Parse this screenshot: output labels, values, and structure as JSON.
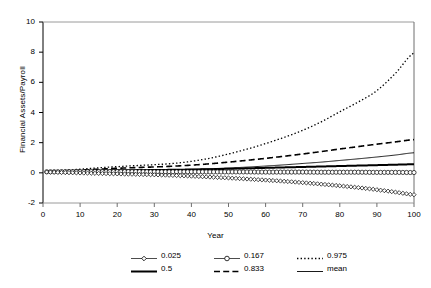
{
  "chart_data": {
    "type": "line",
    "title": "",
    "xlabel": "Year",
    "ylabel": "Financial Assets/Payroll",
    "xlim": [
      0,
      100
    ],
    "ylim": [
      -2,
      10
    ],
    "xticks": [
      "0",
      "10",
      "20",
      "30",
      "40",
      "50",
      "60",
      "70",
      "80",
      "90",
      "100"
    ],
    "yticks": [
      "-2",
      "0",
      "2",
      "4",
      "6",
      "8",
      "10"
    ],
    "grid": false,
    "legend_position": "below",
    "x": [
      1,
      5,
      10,
      15,
      20,
      25,
      30,
      35,
      40,
      45,
      50,
      55,
      60,
      65,
      70,
      75,
      80,
      85,
      90,
      95,
      100
    ],
    "series": [
      {
        "name": "0.025",
        "label": "0.025",
        "style": "line-marker-diamond",
        "color": "#000000",
        "values": [
          0.05,
          0.02,
          -0.01,
          -0.04,
          -0.07,
          -0.1,
          -0.13,
          -0.17,
          -0.22,
          -0.28,
          -0.34,
          -0.41,
          -0.48,
          -0.56,
          -0.65,
          -0.75,
          -0.86,
          -0.98,
          -1.12,
          -1.28,
          -1.45
        ]
      },
      {
        "name": "0.167",
        "label": "0.167",
        "style": "line-marker-circle",
        "color": "#000000",
        "values": [
          0.07,
          0.08,
          0.08,
          0.08,
          0.08,
          0.08,
          0.07,
          0.07,
          0.07,
          0.06,
          0.06,
          0.06,
          0.05,
          0.05,
          0.05,
          0.04,
          0.04,
          0.04,
          0.03,
          0.03,
          0.02
        ]
      },
      {
        "name": "0.975",
        "label": "0.975",
        "style": "dotted",
        "color": "#000000",
        "values": [
          0.1,
          0.16,
          0.24,
          0.33,
          0.41,
          0.48,
          0.54,
          0.62,
          0.76,
          0.97,
          1.25,
          1.57,
          1.94,
          2.35,
          2.82,
          3.38,
          4.05,
          4.7,
          5.45,
          6.6,
          7.95
        ]
      },
      {
        "name": "0.5",
        "label": "0.5",
        "style": "thick-solid",
        "color": "#000000",
        "values": [
          0.08,
          0.11,
          0.13,
          0.15,
          0.17,
          0.18,
          0.19,
          0.2,
          0.22,
          0.24,
          0.27,
          0.3,
          0.33,
          0.36,
          0.39,
          0.42,
          0.45,
          0.48,
          0.51,
          0.54,
          0.57
        ]
      },
      {
        "name": "0.833",
        "label": "0.833",
        "style": "dashed",
        "color": "#000000",
        "values": [
          0.09,
          0.13,
          0.18,
          0.24,
          0.3,
          0.35,
          0.39,
          0.44,
          0.51,
          0.6,
          0.71,
          0.83,
          0.96,
          1.1,
          1.25,
          1.41,
          1.58,
          1.74,
          1.9,
          2.05,
          2.2
        ]
      },
      {
        "name": "mean",
        "label": "mean",
        "style": "thin-solid",
        "color": "#000000",
        "values": [
          0.08,
          0.1,
          0.12,
          0.14,
          0.16,
          0.17,
          0.18,
          0.2,
          0.23,
          0.27,
          0.32,
          0.38,
          0.45,
          0.53,
          0.62,
          0.71,
          0.82,
          0.93,
          1.05,
          1.18,
          1.33
        ]
      }
    ]
  },
  "legend": {
    "rows": [
      [
        {
          "label": "0.025",
          "swatch": "line-marker-diamond"
        },
        {
          "label": "0.167",
          "swatch": "line-marker-circle"
        },
        {
          "label": "0.975",
          "swatch": "dotted"
        }
      ],
      [
        {
          "label": "0.5",
          "swatch": "thick-solid"
        },
        {
          "label": "0.833",
          "swatch": "dashed"
        },
        {
          "label": "mean",
          "swatch": "thin-solid"
        }
      ]
    ]
  }
}
